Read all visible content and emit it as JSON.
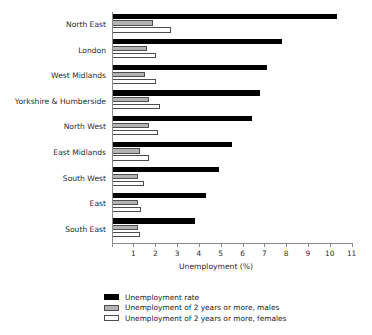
{
  "chart_data": {
    "type": "bar",
    "orientation": "horizontal",
    "title": "",
    "xlabel": "Unemployment (%)",
    "ylabel": "",
    "xlim": [
      0,
      11
    ],
    "xticks": [
      0,
      1,
      2,
      3,
      4,
      5,
      6,
      7,
      8,
      9,
      10,
      11
    ],
    "xtick_labels": [
      "",
      "1",
      "2",
      "3",
      "4",
      "5",
      "6",
      "7",
      "8",
      "9",
      "10",
      "11"
    ],
    "grid": false,
    "legend_position": "bottom-center",
    "categories": [
      "North East",
      "London",
      "West Midlands",
      "Yorkshire & Humberside",
      "North West",
      "East Midlands",
      "South West",
      "East",
      "South East"
    ],
    "series": [
      {
        "name": "Unemployment rate",
        "color": "#000000",
        "values": [
          10.3,
          7.8,
          7.1,
          6.8,
          6.4,
          5.5,
          4.9,
          4.3,
          3.8
        ]
      },
      {
        "name": "Unemployment of 2 years or more, males",
        "color": "#b3b3b3",
        "values": [
          1.9,
          1.6,
          1.5,
          1.7,
          1.7,
          1.3,
          1.2,
          1.2,
          1.2
        ]
      },
      {
        "name": "Unemployment of 2 years or more, females",
        "color": "#ffffff",
        "values": [
          2.7,
          2.0,
          2.0,
          2.2,
          2.1,
          1.7,
          1.45,
          1.35,
          1.3
        ]
      }
    ]
  },
  "axis": {
    "x_title": "Unemployment (%)"
  },
  "legend": {
    "items": [
      {
        "label": "Unemployment rate",
        "swatch": "rate"
      },
      {
        "label": "Unemployment of 2 years or more, males",
        "swatch": "males"
      },
      {
        "label": "Unemployment of 2 years or more, females",
        "swatch": "females"
      }
    ]
  }
}
